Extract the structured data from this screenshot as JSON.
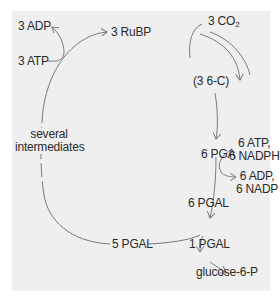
{
  "diagram": {
    "type": "metabolic-cycle",
    "cycle_name": "Calvin cycle",
    "nodes": {
      "adp_left": "3 ADP",
      "atp_left": "3 ATP",
      "rubp": "3 RuBP",
      "co2_prefix": "3 CO",
      "co2_sub": "2",
      "six_c": "(3 6-C)",
      "pga": "6 PGA",
      "atp_nadph_line1": "6 ATP,",
      "atp_nadph_line2": "6 NADPH",
      "adp_nadp_line1": "6 ADP,",
      "adp_nadp_line2": "6 NADP",
      "pgal6": "6 PGAL",
      "pgal5": "5 PGAL",
      "pgal1": "1 PGAL",
      "glucose": "glucose-6-P",
      "intermediates_line1": "several",
      "intermediates_line2": "intermediates"
    },
    "edges": [
      {
        "from": "3 RuBP",
        "to": "(3 6-C)",
        "input": "3 CO2"
      },
      {
        "from": "(3 6-C)",
        "to": "6 PGA"
      },
      {
        "from": "6 PGA",
        "to": "6 PGAL",
        "input": "6 ATP, 6 NADPH",
        "output": "6 ADP, 6 NADP"
      },
      {
        "from": "6 PGAL",
        "to": "5 PGAL"
      },
      {
        "from": "6 PGAL",
        "to": "1 PGAL"
      },
      {
        "from": "1 PGAL",
        "to": "glucose-6-P"
      },
      {
        "from": "5 PGAL",
        "to": "3 RuBP",
        "via": "several intermediates",
        "input": "3 ATP",
        "output": "3 ADP"
      }
    ],
    "colors": {
      "panel": "#efefef",
      "line": "#7a7a7a",
      "text": "#2a2a2a"
    }
  }
}
